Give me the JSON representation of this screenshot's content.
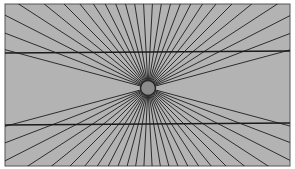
{
  "figure": {
    "name": "Hering illusion",
    "colors": {
      "page_background": "#ffffff",
      "panel_background": "#b3b3b3",
      "panel_border": "#555555",
      "ray_color": "#1e1e1e",
      "horizontal_line_color": "#1a1a1a",
      "center_disc_fill": "#8c8c8c",
      "center_disc_stroke": "#2a2a2a"
    },
    "ray_count": 60,
    "ray_exclusion_from_horizontal_deg": 11,
    "horizontal_lines": 2
  }
}
